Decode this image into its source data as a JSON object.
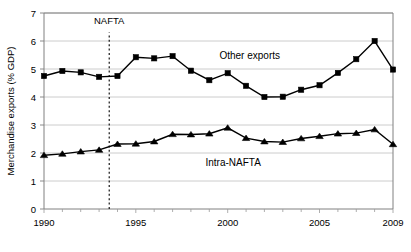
{
  "chart_data": {
    "type": "line",
    "title": "",
    "xlabel": "",
    "ylabel": "Merchandise exports (% GDP)",
    "x": [
      1990,
      1991,
      1992,
      1993,
      1994,
      1995,
      1996,
      1997,
      1998,
      1999,
      2000,
      2001,
      2002,
      2003,
      2004,
      2005,
      2006,
      2007,
      2008,
      2009
    ],
    "xlim": [
      1990,
      2009
    ],
    "ylim": [
      0,
      7
    ],
    "yticks": [
      0,
      1,
      2,
      3,
      4,
      5,
      6,
      7
    ],
    "ytick_labels": [
      "0",
      "1",
      "2",
      "3",
      "4",
      "5",
      "6",
      "7"
    ],
    "xticks_major": [
      1990,
      1995,
      2000,
      2005,
      2009
    ],
    "xtick_labels": [
      "1990",
      "1995",
      "2000",
      "2005",
      "2009"
    ],
    "grid": "horizontal",
    "legend_position": "inline-annotations",
    "series": [
      {
        "name": "Other exports",
        "marker": "square",
        "color": "#000000",
        "label_x": 2001.2,
        "label_y": 5.35,
        "values": [
          4.75,
          4.93,
          4.88,
          4.72,
          4.75,
          5.42,
          5.38,
          5.46,
          4.94,
          4.6,
          4.85,
          4.4,
          4.0,
          4.01,
          4.26,
          4.42,
          4.86,
          5.35,
          6.0,
          4.98
        ]
      },
      {
        "name": "Intra-NAFTA",
        "marker": "triangle",
        "color": "#000000",
        "label_x": 2000.3,
        "label_y": 1.55,
        "values": [
          1.92,
          1.97,
          2.05,
          2.11,
          2.32,
          2.33,
          2.41,
          2.67,
          2.66,
          2.69,
          2.9,
          2.53,
          2.41,
          2.39,
          2.52,
          2.6,
          2.69,
          2.71,
          2.84,
          2.31
        ]
      }
    ],
    "annotations": [
      {
        "name": "NAFTA",
        "label": "NAFTA",
        "x": 1993.55,
        "label_y": 6.62,
        "line_from_y": 0,
        "line_to_y": 6.3,
        "style": "dotted-vertical"
      }
    ]
  }
}
